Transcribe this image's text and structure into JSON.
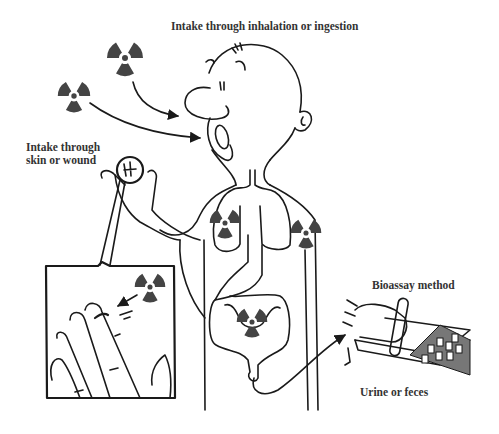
{
  "diagram": {
    "type": "illustration",
    "labels": {
      "inhalation_ingestion": "Intake through inhalation or ingestion",
      "skin_wound_line1": "Intake through",
      "skin_wound_line2": "skin or wound",
      "bioassay": "Bioassay method",
      "excreta": "Urine or feces"
    },
    "icons": {
      "radiation": "radiation-trefoil-icon"
    },
    "colors": {
      "ink": "#1a1a1a",
      "trefoil": "#444444",
      "text": "#333333",
      "background": "#ffffff"
    },
    "nodes": [
      {
        "id": "source-air-1",
        "kind": "radiation-symbol",
        "x": 125,
        "y": 58
      },
      {
        "id": "source-air-2",
        "kind": "radiation-symbol",
        "x": 74,
        "y": 96
      },
      {
        "id": "lungs",
        "kind": "organ-with-radiation",
        "x": 225,
        "y": 224
      },
      {
        "id": "arm-tissue",
        "kind": "organ-with-radiation",
        "x": 306,
        "y": 234
      },
      {
        "id": "intestine",
        "kind": "organ-with-radiation",
        "x": 252,
        "y": 322
      },
      {
        "id": "wound-inset",
        "kind": "magnified-finger",
        "x": 46,
        "y": 266
      },
      {
        "id": "bioassay-lab",
        "kind": "test-tube-rack",
        "x": 380,
        "y": 330
      }
    ],
    "edges": [
      {
        "from": "source-air-1",
        "to": "nose",
        "label": "Intake through inhalation or ingestion"
      },
      {
        "from": "source-air-2",
        "to": "mouth",
        "label": "Intake through inhalation or ingestion"
      },
      {
        "from": "radiation-in-inset",
        "to": "finger-wound",
        "label": "Intake through skin or wound"
      },
      {
        "from": "intestine",
        "to": "bioassay-lab",
        "label": "Urine or feces"
      }
    ]
  }
}
